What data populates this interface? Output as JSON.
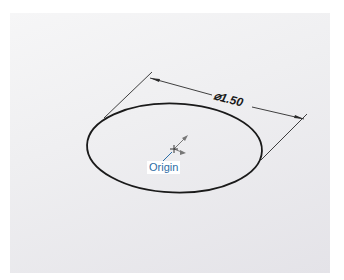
{
  "sketch": {
    "dimension": {
      "label": "⌀1.50",
      "value": 1.5,
      "type": "diameter"
    },
    "origin": {
      "label": "Origin",
      "icon": "origin-axes-icon"
    },
    "entity": "circle",
    "colors": {
      "geometry": "#1a1a1a",
      "origin_label": "#2d6ea6",
      "background": "#efeff1"
    }
  }
}
